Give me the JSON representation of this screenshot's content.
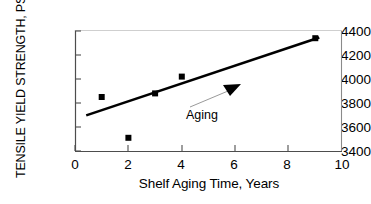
{
  "chart_data": {
    "type": "scatter",
    "title": "",
    "xlabel": "Shelf Aging Time, Years",
    "ylabel": "TENSILE YIELD STRENGTH, PSI",
    "xlim": [
      0,
      10
    ],
    "ylim": [
      3400,
      4400
    ],
    "xticks": [
      0,
      2,
      4,
      6,
      8,
      10
    ],
    "xtick_labels": [
      "0",
      "2",
      "4",
      "6",
      "8",
      "10"
    ],
    "yticks": [
      3400,
      3600,
      3800,
      4000,
      4200,
      4400
    ],
    "ytick_labels": [
      "3400",
      "3600",
      "3800",
      "4000",
      "4200",
      "4400"
    ],
    "grid": false,
    "legend": null,
    "marker": "square",
    "marker_color": "#000000",
    "line_color": "#000000",
    "series": [
      {
        "name": "Tensile yield strength",
        "x": [
          1,
          2,
          3,
          4,
          9
        ],
        "y": [
          3850,
          3510,
          3880,
          4020,
          4340
        ]
      }
    ],
    "trendline": {
      "type": "linear",
      "x": [
        0.42,
        9.15
      ],
      "y": [
        3697,
        4345
      ]
    },
    "annotations": [
      {
        "text": "Aging",
        "arrow": "triangle-pointing-up-right",
        "x": 5.9,
        "y": 3995
      }
    ]
  },
  "axes": {
    "x_title": "Shelf Aging Time, Years",
    "y_title": "TENSILE YIELD STRENGTH, PSI"
  },
  "annotation": {
    "aging_label": "Aging"
  }
}
